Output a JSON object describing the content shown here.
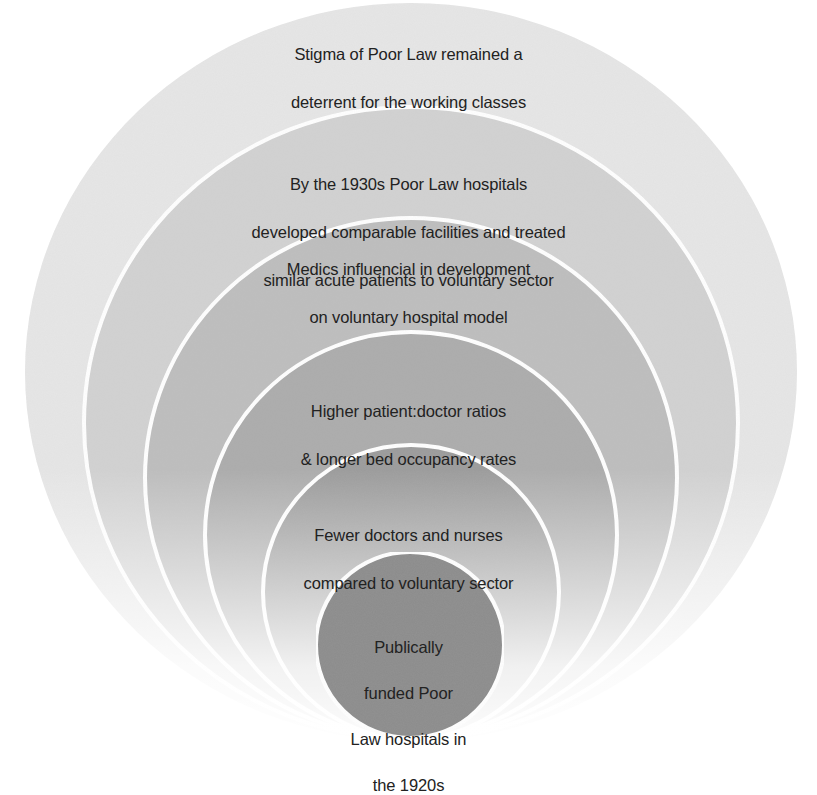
{
  "diagram": {
    "type": "nested-circles",
    "title": "",
    "rings": [
      {
        "level": 1,
        "lines": [
          "Stigma of Poor Law remained a",
          "deterrent for the working classes"
        ],
        "fill": "#e6e6e6"
      },
      {
        "level": 2,
        "lines": [
          "By the 1930s Poor Law  hospitals",
          "developed comparable facilities and treated",
          "similar acute patients to voluntary sector"
        ],
        "fill": "#d2d2d2"
      },
      {
        "level": 3,
        "lines": [
          "Medics influencial in development",
          "on voluntary hospital model"
        ],
        "fill": "#bebebe"
      },
      {
        "level": 4,
        "lines": [
          "Higher patient:doctor ratios",
          "& longer bed occupancy rates"
        ],
        "fill": "#acacac"
      },
      {
        "level": 5,
        "lines": [
          "Fewer doctors and nurses",
          "compared to voluntary sector"
        ],
        "fill": "#9b9b9b"
      },
      {
        "level": 6,
        "lines": [
          "Publically",
          "funded Poor",
          "Law hospitals in",
          "the 1920s"
        ],
        "fill": "#8c8c8c"
      }
    ],
    "outline_color": "#ffffff"
  }
}
